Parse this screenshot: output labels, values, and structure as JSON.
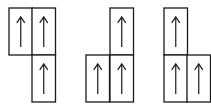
{
  "diagram": {
    "cell_width": 23.5,
    "cell_height": 47,
    "line_color": "#1a1a1a",
    "background": "#ffffff",
    "groups": [
      {
        "name": "tromino-1",
        "cells": [
          {
            "x": 9,
            "y": 8,
            "arrow": "up"
          },
          {
            "x": 32,
            "y": 8,
            "arrow": "up"
          },
          {
            "x": 32,
            "y": 55,
            "arrow": "up"
          }
        ]
      },
      {
        "name": "tromino-2",
        "cells": [
          {
            "x": 110,
            "y": 8,
            "arrow": "up"
          },
          {
            "x": 86,
            "y": 55,
            "arrow": "up"
          },
          {
            "x": 110,
            "y": 55,
            "arrow": "up"
          }
        ]
      },
      {
        "name": "tromino-3",
        "cells": [
          {
            "x": 164,
            "y": 8,
            "arrow": "up"
          },
          {
            "x": 164,
            "y": 55,
            "arrow": "up"
          },
          {
            "x": 187,
            "y": 55,
            "arrow": "up"
          }
        ]
      }
    ]
  }
}
